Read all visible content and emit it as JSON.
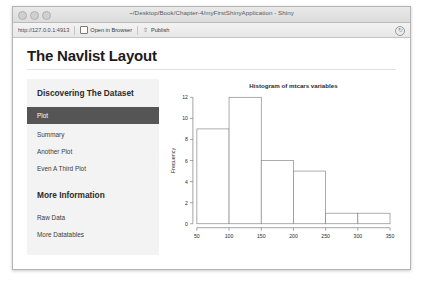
{
  "window": {
    "title": "~/Desktop/Book/Chapter-4/myFirstShinyApplication - Shiny",
    "lights": [
      "close",
      "minimize",
      "zoom"
    ]
  },
  "toolbar": {
    "url": "http://127.0.0.1:4913",
    "open_in_browser_label": "Open in Browser",
    "publish_label": "Publish",
    "refresh_icon": "refresh-icon",
    "browser_icon": "browser-window-icon",
    "publish_icon": "publish-upload-icon"
  },
  "page": {
    "heading": "The Navlist Layout"
  },
  "navlist": {
    "groups": [
      {
        "header": "Discovering The Dataset",
        "items": [
          {
            "label": "Plot",
            "active": true
          },
          {
            "label": "Summary",
            "active": false
          },
          {
            "label": "Another Plot",
            "active": false
          },
          {
            "label": "Even A Third Plot",
            "active": false
          }
        ]
      },
      {
        "header": "More Information",
        "items": [
          {
            "label": "Raw Data",
            "active": false
          },
          {
            "label": "More Datatables",
            "active": false
          }
        ]
      }
    ]
  },
  "chart_data": {
    "type": "bar",
    "title": "Histogram of mtcars variables",
    "xlabel": "",
    "ylabel": "Frequency",
    "bin_edges": [
      50,
      100,
      150,
      200,
      250,
      300,
      350
    ],
    "categories": [
      "50-100",
      "100-150",
      "150-200",
      "200-250",
      "250-300",
      "300-350"
    ],
    "values": [
      9,
      12,
      6,
      5,
      1,
      1
    ],
    "xticks": [
      50,
      100,
      150,
      200,
      250,
      300,
      350
    ],
    "yticks": [
      0,
      2,
      4,
      6,
      8,
      10,
      12
    ],
    "xlim": [
      50,
      350
    ],
    "ylim": [
      0,
      12
    ],
    "grid": false,
    "legend": false,
    "bar_fill": "#ffffff",
    "bar_stroke": "#888888",
    "axis_color": "#7d7d7d",
    "text_color": "#2b2b2b"
  }
}
